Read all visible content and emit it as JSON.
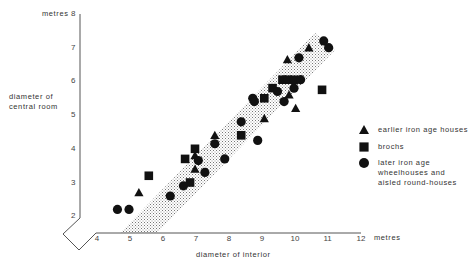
{
  "chart_data": {
    "type": "scatter",
    "title": "",
    "xlabel": "diameter of interior",
    "ylabel": "diameter of central room",
    "x_unit_label": "12 metres",
    "y_unit_label": "metres 8",
    "xlim": [
      4,
      12
    ],
    "ylim": [
      2,
      8
    ],
    "x_ticks": [
      "4",
      "5",
      "6",
      "7",
      "8",
      "9",
      "10",
      "11",
      "12"
    ],
    "y_ticks": [
      "2",
      "3",
      "4",
      "5",
      "6",
      "7",
      "8"
    ],
    "grid": false,
    "axis_break": "diagonal zig-zag break at origin",
    "shaded_band": {
      "description": "stippled diagonal band",
      "corners_data": [
        [
          4.7,
          1.5
        ],
        [
          5.85,
          1.5
        ],
        [
          11.3,
          6.9
        ],
        [
          10.7,
          7.45
        ]
      ]
    },
    "legend_position": "right",
    "series": [
      {
        "name": "earlier iron age houses",
        "marker": "triangle",
        "points": [
          [
            5.3,
            2.7
          ],
          [
            7.0,
            3.4
          ],
          [
            7.0,
            3.8
          ],
          [
            7.6,
            4.4
          ],
          [
            9.1,
            4.9
          ],
          [
            10.05,
            5.2
          ],
          [
            9.85,
            5.6
          ],
          [
            9.8,
            6.65
          ],
          [
            10.45,
            7.0
          ]
        ]
      },
      {
        "name": "brochs",
        "marker": "square",
        "points": [
          [
            5.6,
            3.2
          ],
          [
            6.7,
            3.7
          ],
          [
            6.85,
            3.0
          ],
          [
            7.0,
            4.0
          ],
          [
            8.4,
            4.4
          ],
          [
            9.1,
            5.5
          ],
          [
            9.35,
            5.8
          ],
          [
            9.65,
            6.05
          ],
          [
            9.8,
            6.05
          ],
          [
            10.0,
            6.05
          ],
          [
            10.85,
            5.75
          ]
        ]
      },
      {
        "name": "later iron age wheelhouses and aisled round-houses",
        "marker": "circle",
        "points": [
          [
            4.65,
            2.2
          ],
          [
            5.0,
            2.2
          ],
          [
            6.25,
            2.6
          ],
          [
            6.65,
            2.9
          ],
          [
            7.3,
            3.3
          ],
          [
            7.1,
            3.65
          ],
          [
            7.6,
            4.15
          ],
          [
            7.9,
            3.7
          ],
          [
            8.4,
            4.8
          ],
          [
            8.9,
            4.25
          ],
          [
            8.75,
            5.5
          ],
          [
            8.8,
            5.4
          ],
          [
            9.5,
            5.7
          ],
          [
            9.7,
            5.4
          ],
          [
            10.0,
            5.8
          ],
          [
            10.2,
            6.05
          ],
          [
            10.15,
            6.7
          ],
          [
            10.9,
            7.2
          ],
          [
            11.05,
            7.0
          ]
        ]
      }
    ]
  },
  "labels": {
    "y_unit": "metres",
    "y_axis_title_line1": "diameter of",
    "y_axis_title_line2": "central room",
    "x_axis_title": "diameter of interior",
    "x_unit": "metres"
  },
  "legend": {
    "items": [
      {
        "marker": "triangle",
        "lines": [
          "earlier iron age houses"
        ]
      },
      {
        "marker": "square",
        "lines": [
          "brochs"
        ]
      },
      {
        "marker": "circle",
        "lines": [
          "later iron age",
          "wheelhouses and",
          "aisled round-houses"
        ]
      }
    ]
  },
  "colors": {
    "marker": "#111111",
    "axis": "#555555",
    "band": "#888888"
  }
}
